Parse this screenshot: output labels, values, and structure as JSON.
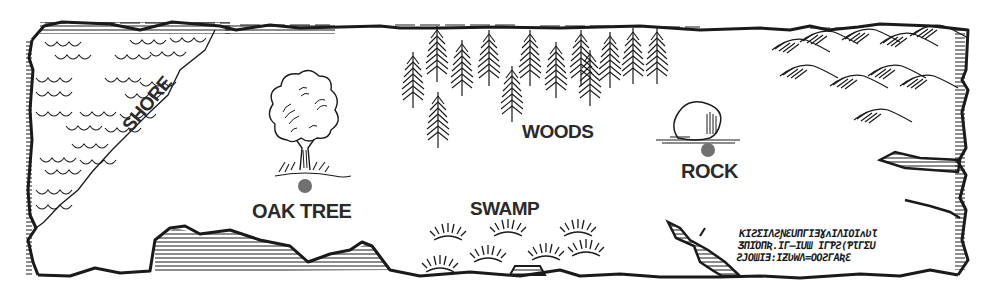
{
  "map": {
    "style": "black-and-white hand-drawn treasure map",
    "marker_color": "#707070",
    "ink_color": "#1a1a1a",
    "locations": [
      {
        "id": "shore",
        "label": "SHORE",
        "has_marker": false
      },
      {
        "id": "oak-tree",
        "label": "OAK TREE",
        "has_marker": true
      },
      {
        "id": "woods",
        "label": "WOODS",
        "has_marker": false
      },
      {
        "id": "rock",
        "label": "ROCK",
        "has_marker": true
      },
      {
        "id": "swamp",
        "label": "SWAMP",
        "has_marker": false
      }
    ],
    "terrain": [
      "sea waves",
      "pine forest",
      "mountains",
      "swamp grass",
      "hatched cliffs"
    ],
    "inscription": {
      "lines": [
        "ƘIƧƩIΛƧƝƐUΠΓIƎƔʌIΛIΟIʌƲƖ",
        "ƷΠIΌΠƦ.IΓ–IUƜ IΓƤƧ(ƤƖΓƩU",
        "ƧJΟƜIƎ:IƵƲWΛ=ΟΟƧΓΑƦƐ"
      ]
    }
  }
}
